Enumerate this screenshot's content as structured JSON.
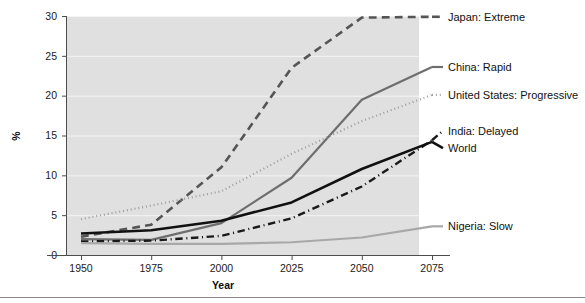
{
  "chart_data": {
    "type": "line",
    "title": "",
    "xlabel": "Year",
    "ylabel": "%",
    "x": [
      1950,
      1975,
      2000,
      2025,
      2050,
      2075
    ],
    "xtick_labels": [
      "1950",
      "1975",
      "2000",
      "2025",
      "2050",
      "2075"
    ],
    "ytick_labels": [
      "0",
      "5",
      "10",
      "15",
      "20",
      "25",
      "30"
    ],
    "yticks": [
      0,
      5,
      10,
      15,
      20,
      25,
      30
    ],
    "xlim": [
      1950,
      2075
    ],
    "ylim": [
      0,
      30
    ],
    "grid": "horizontal",
    "legend_position": "right-of-plot-direct-labels",
    "panel_background": "#e0e0e0",
    "series": [
      {
        "name": "Japan: Extreme",
        "label": "Japan: Extreme",
        "values": [
          2.3,
          3.8,
          11.0,
          23.5,
          29.8,
          29.9
        ],
        "color": "#555555",
        "dash": "dashed",
        "width": 2.6,
        "label_y_pct": 29.9
      },
      {
        "name": "China: Rapid",
        "label": "China: Rapid",
        "values": [
          2.0,
          1.9,
          4.0,
          9.7,
          19.5,
          23.6
        ],
        "color": "#6e6e6e",
        "dash": "solid",
        "width": 2.2,
        "label_y_pct": 23.6
      },
      {
        "name": "United States: Progressive",
        "label": "United States: Progressive",
        "values": [
          4.5,
          6.2,
          8.0,
          12.7,
          16.8,
          20.1
        ],
        "color": "#999999",
        "dash": "dotted",
        "width": 2.2,
        "label_y_pct": 20.1
      },
      {
        "name": "India: Delayed",
        "label": "India: Delayed",
        "values": [
          1.7,
          1.8,
          2.4,
          4.6,
          8.6,
          14.4
        ],
        "color": "#1a1a1a",
        "dash": "dashdot",
        "width": 2.4,
        "label_y_pct": 15.6
      },
      {
        "name": "World",
        "label": "World",
        "values": [
          2.7,
          3.1,
          4.3,
          6.6,
          10.8,
          14.2
        ],
        "color": "#111111",
        "dash": "solid",
        "width": 2.6,
        "label_y_pct": 13.4
      },
      {
        "name": "Nigeria: Slow",
        "label": "Nigeria: Slow",
        "values": [
          1.5,
          1.4,
          1.4,
          1.6,
          2.2,
          3.6
        ],
        "color": "#a8a8a8",
        "dash": "solid",
        "width": 2.2,
        "label_y_pct": 3.6
      }
    ]
  },
  "figure": {
    "xlabel": "Year",
    "ylabel": "%",
    "xticks": [
      "1950",
      "1975",
      "2000",
      "2025",
      "2050",
      "2075"
    ],
    "yticks": [
      "0",
      "5",
      "10",
      "15",
      "20",
      "25",
      "30"
    ],
    "labels": {
      "japan": "Japan: Extreme",
      "china": "China: Rapid",
      "usa": "United States: Progressive",
      "india": "India: Delayed",
      "world": "World",
      "nigeria": "Nigeria: Slow"
    }
  }
}
